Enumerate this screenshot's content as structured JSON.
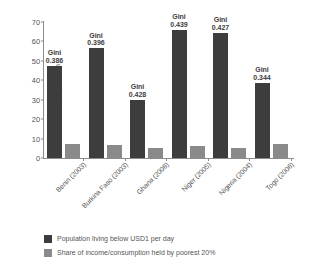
{
  "chart_data": {
    "type": "bar",
    "title": "",
    "xlabel": "",
    "ylabel": "% of population",
    "ylim": [
      0,
      70
    ],
    "yticks": [
      0,
      10,
      20,
      30,
      40,
      50,
      60,
      70
    ],
    "grid": false,
    "legend_position": "bottom-left",
    "categories": [
      "Benin (2003)",
      "Burkina Faso (2003)",
      "Ghana (2006)",
      "Niger (2005)",
      "Nigeria (2004)",
      "Togo (2006)"
    ],
    "series": [
      {
        "name": "Population living below USD1 per day",
        "color": "#3d3d3d",
        "values": [
          47.3,
          56.5,
          30.0,
          65.9,
          64.4,
          38.7
        ]
      },
      {
        "name": "Share of income/consumption held by poorest 20%",
        "color": "#8a8a8a",
        "values": [
          7.4,
          6.9,
          5.2,
          6.1,
          5.0,
          7.4
        ]
      }
    ],
    "annotations": [
      {
        "category": "Benin (2003)",
        "label": "Gini",
        "value": "0.386"
      },
      {
        "category": "Burkina Faso (2003)",
        "label": "Gini",
        "value": "0.396"
      },
      {
        "category": "Ghana (2006)",
        "label": "Gini",
        "value": "0.428"
      },
      {
        "category": "Niger (2005)",
        "label": "Gini",
        "value": "0.439"
      },
      {
        "category": "Nigeria (2004)",
        "label": "Gini",
        "value": "0.427"
      },
      {
        "category": "Togo (2006)",
        "label": "Gini",
        "value": "0.344"
      }
    ]
  },
  "axis": {
    "y_title": "% of population",
    "y_ticks": [
      "70",
      "60",
      "50",
      "40",
      "30",
      "20",
      "10",
      "0"
    ]
  },
  "x_labels": [
    "Benin (2003)",
    "Burkina Faso (2003)",
    "Ghana (2006)",
    "Niger (2005)",
    "Nigeria (2004)",
    "Togo (2006)"
  ],
  "gini_labels": [
    {
      "title": "Gini",
      "value": "0.386"
    },
    {
      "title": "Gini",
      "value": "0.396"
    },
    {
      "title": "Gini",
      "value": "0.428"
    },
    {
      "title": "Gini",
      "value": "0.439"
    },
    {
      "title": "Gini",
      "value": "0.427"
    },
    {
      "title": "Gini",
      "value": "0.344"
    }
  ],
  "legend": {
    "items": [
      {
        "label": "Population living below USD1 per day",
        "color": "#3d3d3d"
      },
      {
        "label": "Share of income/consumption held by poorest 20%",
        "color": "#8a8a8a"
      }
    ]
  }
}
